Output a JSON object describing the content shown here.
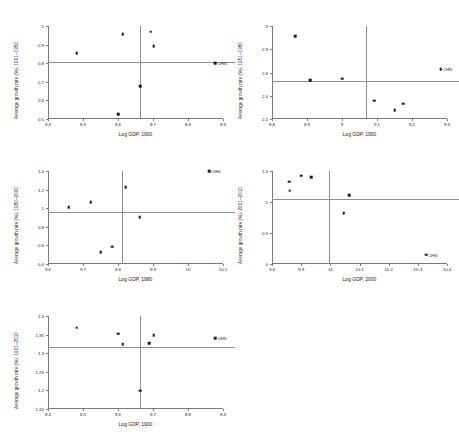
{
  "figure": {
    "panel_count": 5,
    "marker_color": "#1a1a1a",
    "refline_color": "#8e8e8e",
    "axis_color": "#7a7a7a",
    "background": "#ffffff"
  },
  "chart_data": [
    {
      "id": "panel-1",
      "type": "scatter",
      "title": "",
      "xlabel": "Log GDP, 1900",
      "ylabel": "Average growth rate (%), 1901–1950",
      "xlim": [
        8.4,
        8.9
      ],
      "ylim": [
        0.5,
        1.0
      ],
      "xticks": [
        "8.4",
        "8.5",
        "8.6",
        "8.7",
        "8.8",
        "8.9"
      ],
      "xtickvals": [
        8.4,
        8.5,
        8.6,
        8.7,
        8.8,
        8.9
      ],
      "yticks": [
        "0.5",
        "0.6",
        "0.7",
        "0.8",
        "0.9",
        "1"
      ],
      "ytickvals": [
        0.5,
        0.6,
        0.7,
        0.8,
        0.9,
        1.0
      ],
      "hline": 0.807,
      "vline": 8.663,
      "grid": false,
      "legend": "none",
      "points": [
        {
          "x": 8.482,
          "y": 0.855,
          "label": ""
        },
        {
          "x": 8.601,
          "y": 0.527,
          "label": ""
        },
        {
          "x": 8.614,
          "y": 0.956,
          "label": ""
        },
        {
          "x": 8.663,
          "y": 0.677,
          "label": ""
        },
        {
          "x": 8.694,
          "y": 0.969,
          "label": ""
        },
        {
          "x": 8.702,
          "y": 0.892,
          "label": ""
        },
        {
          "x": 8.878,
          "y": 0.8,
          "label": "CHN"
        }
      ]
    },
    {
      "id": "panel-2",
      "type": "scatter",
      "title": "",
      "xlabel": "Log GDP, 1950",
      "ylabel": "Average growth rate (%), 1951–1980",
      "xlim": [
        8.8,
        9.3
      ],
      "ylim": [
        2.2,
        3.0
      ],
      "xticks": [
        "8.8",
        "8.9",
        "9",
        "9.1",
        "9.2",
        "9.3"
      ],
      "xtickvals": [
        8.8,
        8.9,
        9.0,
        9.1,
        9.2,
        9.3
      ],
      "yticks": [
        "2.2",
        "2.4",
        "2.6",
        "2.8",
        "3"
      ],
      "ytickvals": [
        2.2,
        2.4,
        2.6,
        2.8,
        3.0
      ],
      "hline": 2.527,
      "vline": 9.069,
      "grid": false,
      "legend": "none",
      "points": [
        {
          "x": 8.866,
          "y": 2.912,
          "label": ""
        },
        {
          "x": 8.909,
          "y": 2.536,
          "label": ""
        },
        {
          "x": 9.0,
          "y": 2.545,
          "label": ""
        },
        {
          "x": 9.092,
          "y": 2.357,
          "label": ""
        },
        {
          "x": 9.15,
          "y": 2.278,
          "label": ""
        },
        {
          "x": 9.175,
          "y": 2.331,
          "label": ""
        },
        {
          "x": 9.282,
          "y": 2.627,
          "label": "CHN"
        }
      ]
    },
    {
      "id": "panel-3",
      "type": "scatter",
      "title": "",
      "xlabel": "Log GDP, 1980",
      "ylabel": "Average growth rate (%), 1980–2000",
      "xlim": [
        9.6,
        10.1
      ],
      "ylim": [
        0.4,
        1.4
      ],
      "xticks": [
        "9.6",
        "9.7",
        "9.8",
        "9.9",
        "10",
        "10.1"
      ],
      "xtickvals": [
        9.6,
        9.7,
        9.8,
        9.9,
        10.0,
        10.1
      ],
      "yticks": [
        "0.4",
        "0.6",
        "0.8",
        "1",
        "1.2",
        "1.4"
      ],
      "ytickvals": [
        0.4,
        0.6,
        0.8,
        1.0,
        1.2,
        1.4
      ],
      "hline": 0.957,
      "vline": 9.812,
      "grid": false,
      "legend": "none",
      "points": [
        {
          "x": 9.659,
          "y": 1.008,
          "label": ""
        },
        {
          "x": 9.722,
          "y": 1.066,
          "label": ""
        },
        {
          "x": 9.75,
          "y": 0.53,
          "label": ""
        },
        {
          "x": 9.783,
          "y": 0.584,
          "label": ""
        },
        {
          "x": 9.822,
          "y": 1.225,
          "label": ""
        },
        {
          "x": 9.862,
          "y": 0.906,
          "label": ""
        },
        {
          "x": 10.06,
          "y": 1.395,
          "label": "CHN"
        }
      ]
    },
    {
      "id": "panel-4",
      "type": "scatter",
      "title": "",
      "xlabel": "Log GDP, 2000",
      "ylabel": "Average growth rate (%), 2001–2010",
      "xlim": [
        9.8,
        10.4
      ],
      "ylim": [
        0.0,
        1.5
      ],
      "xticks": [
        "9.8",
        "9.9",
        "10",
        "10.1",
        "10.2",
        "10.3",
        "10.4"
      ],
      "xtickvals": [
        9.8,
        9.9,
        10.0,
        10.1,
        10.2,
        10.3,
        10.4
      ],
      "yticks": [
        "0",
        "0.5",
        "1",
        "1.5"
      ],
      "ytickvals": [
        0.0,
        0.5,
        1.0,
        1.5
      ],
      "hline": 1.053,
      "vline": 9.997,
      "grid": false,
      "legend": "none",
      "points": [
        {
          "x": 9.859,
          "y": 1.327,
          "label": ""
        },
        {
          "x": 9.861,
          "y": 1.181,
          "label": ""
        },
        {
          "x": 9.901,
          "y": 1.425,
          "label": ""
        },
        {
          "x": 9.935,
          "y": 1.404,
          "label": ""
        },
        {
          "x": 10.046,
          "y": 0.824,
          "label": ""
        },
        {
          "x": 10.065,
          "y": 1.113,
          "label": ""
        },
        {
          "x": 10.328,
          "y": 0.152,
          "label": "CHN"
        }
      ]
    },
    {
      "id": "panel-5",
      "type": "scatter",
      "title": "",
      "xlabel": "Log GDP, 1900",
      "ylabel": "Average growth rate (%), 1901–2010",
      "xlim": [
        8.4,
        8.9
      ],
      "ylim": [
        1.15,
        1.4
      ],
      "xticks": [
        "8.4",
        "8.5",
        "8.6",
        "8.7",
        "8.8",
        "8.9"
      ],
      "xtickvals": [
        8.4,
        8.5,
        8.6,
        8.7,
        8.8,
        8.9
      ],
      "yticks": [
        "1.15",
        "1.2",
        "1.25",
        "1.3",
        "1.35",
        "1.4"
      ],
      "ytickvals": [
        1.15,
        1.2,
        1.25,
        1.3,
        1.35,
        1.4
      ],
      "hline": 1.318,
      "vline": 8.663,
      "grid": false,
      "legend": "none",
      "points": [
        {
          "x": 8.482,
          "y": 1.368,
          "label": ""
        },
        {
          "x": 8.601,
          "y": 1.352,
          "label": ""
        },
        {
          "x": 8.614,
          "y": 1.324,
          "label": ""
        },
        {
          "x": 8.663,
          "y": 1.199,
          "label": ""
        },
        {
          "x": 8.689,
          "y": 1.327,
          "label": ""
        },
        {
          "x": 8.702,
          "y": 1.349,
          "label": ""
        },
        {
          "x": 8.878,
          "y": 1.34,
          "label": "CHN"
        }
      ]
    }
  ],
  "panel_layout": [
    {
      "id": "panel-1",
      "left": 8,
      "top": 8,
      "plot_left": 40,
      "plot_top": 18,
      "plot_width": 175,
      "plot_height": 93
    },
    {
      "id": "panel-2",
      "left": 232,
      "top": 8,
      "plot_left": 40,
      "plot_top": 18,
      "plot_width": 175,
      "plot_height": 93
    },
    {
      "id": "panel-3",
      "left": 8,
      "top": 153,
      "plot_left": 40,
      "plot_top": 18,
      "plot_width": 175,
      "plot_height": 93
    },
    {
      "id": "panel-4",
      "left": 232,
      "top": 153,
      "plot_left": 40,
      "plot_top": 18,
      "plot_width": 175,
      "plot_height": 93
    },
    {
      "id": "panel-5",
      "left": 8,
      "top": 298,
      "plot_left": 40,
      "plot_top": 18,
      "plot_width": 175,
      "plot_height": 93
    }
  ]
}
